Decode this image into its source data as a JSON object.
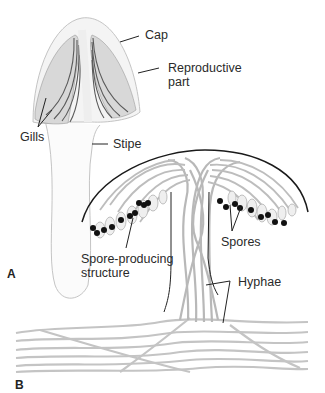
{
  "figure": {
    "panels": [
      {
        "id": "A",
        "letter": "A",
        "subject": "mushroom-fruiting-body"
      },
      {
        "id": "B",
        "letter": "B",
        "subject": "reproductive-part-cross-section"
      }
    ],
    "labels": {
      "cap": "Cap",
      "reproductive_line1": "Reproductive",
      "reproductive_line2": "part",
      "gills": "Gills",
      "stipe": "Stipe",
      "spores": "Spores",
      "spore_producing_line1": "Spore-producing",
      "spore_producing_line2": "structure",
      "hyphae": "Hyphae"
    },
    "colors": {
      "outline": "#b8b8b8",
      "gill_fill": "#d9d9d9",
      "gill_stroke": "#555555",
      "leader": "#222222",
      "spore": "#111111",
      "hyphae": "#c9c9c9",
      "arc": "#1a1a1a"
    }
  }
}
